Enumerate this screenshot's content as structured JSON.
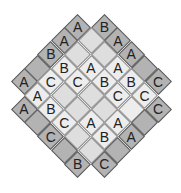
{
  "puzzle": {
    "type": "diagonal-latin-grid",
    "symbols": [
      "A",
      "B",
      "C"
    ],
    "colors": {
      "clue_cell": "#b3b3b3",
      "inner_cell": "#ededed",
      "inner_cell_shaded": "#dedede",
      "border": "#5a5a5a",
      "text": "#222222"
    },
    "cells": [
      {
        "c": 4,
        "r": 0,
        "kind": "clue",
        "v": "A"
      },
      {
        "c": 6,
        "r": 0,
        "kind": "clue",
        "v": "B"
      },
      {
        "c": 3,
        "r": 1,
        "kind": "clue",
        "v": "A"
      },
      {
        "c": 5,
        "r": 1,
        "kind": "inner",
        "v": "",
        "shade": true
      },
      {
        "c": 7,
        "r": 1,
        "kind": "clue",
        "v": "A"
      },
      {
        "c": 2,
        "r": 2,
        "kind": "clue",
        "v": "B"
      },
      {
        "c": 4,
        "r": 2,
        "kind": "inner",
        "v": "",
        "shade": true
      },
      {
        "c": 6,
        "r": 2,
        "kind": "inner",
        "v": "",
        "shade": true
      },
      {
        "c": 8,
        "r": 2,
        "kind": "clue",
        "v": "A"
      },
      {
        "c": 1,
        "r": 3,
        "kind": "clue",
        "v": ""
      },
      {
        "c": 3,
        "r": 3,
        "kind": "inner",
        "v": "B"
      },
      {
        "c": 5,
        "r": 3,
        "kind": "inner",
        "v": "A"
      },
      {
        "c": 7,
        "r": 3,
        "kind": "inner",
        "v": "A"
      },
      {
        "c": 9,
        "r": 3,
        "kind": "clue",
        "v": ""
      },
      {
        "c": 0,
        "r": 4,
        "kind": "clue",
        "v": "A"
      },
      {
        "c": 2,
        "r": 4,
        "kind": "inner",
        "v": "C"
      },
      {
        "c": 4,
        "r": 4,
        "kind": "inner",
        "v": "C"
      },
      {
        "c": 6,
        "r": 4,
        "kind": "inner",
        "v": "B"
      },
      {
        "c": 8,
        "r": 4,
        "kind": "inner",
        "v": "B"
      },
      {
        "c": 10,
        "r": 4,
        "kind": "clue",
        "v": "C"
      },
      {
        "c": 1,
        "r": 5,
        "kind": "inner",
        "v": "A"
      },
      {
        "c": 3,
        "r": 5,
        "kind": "inner",
        "v": "",
        "shade": true
      },
      {
        "c": 5,
        "r": 5,
        "kind": "inner",
        "v": "",
        "shade": true
      },
      {
        "c": 7,
        "r": 5,
        "kind": "inner",
        "v": "C"
      },
      {
        "c": 9,
        "r": 5,
        "kind": "inner",
        "v": "C"
      },
      {
        "c": 0,
        "r": 6,
        "kind": "clue",
        "v": "A"
      },
      {
        "c": 2,
        "r": 6,
        "kind": "inner",
        "v": "B"
      },
      {
        "c": 4,
        "r": 6,
        "kind": "inner",
        "v": "",
        "shade": true
      },
      {
        "c": 6,
        "r": 6,
        "kind": "inner",
        "v": "",
        "shade": true
      },
      {
        "c": 8,
        "r": 6,
        "kind": "inner",
        "v": ""
      },
      {
        "c": 10,
        "r": 6,
        "kind": "clue",
        "v": "C"
      },
      {
        "c": 1,
        "r": 7,
        "kind": "clue",
        "v": ""
      },
      {
        "c": 3,
        "r": 7,
        "kind": "inner",
        "v": "C"
      },
      {
        "c": 5,
        "r": 7,
        "kind": "inner",
        "v": "A"
      },
      {
        "c": 7,
        "r": 7,
        "kind": "inner",
        "v": "A"
      },
      {
        "c": 9,
        "r": 7,
        "kind": "clue",
        "v": ""
      },
      {
        "c": 2,
        "r": 8,
        "kind": "clue",
        "v": "C"
      },
      {
        "c": 4,
        "r": 8,
        "kind": "inner",
        "v": "",
        "shade": true
      },
      {
        "c": 6,
        "r": 8,
        "kind": "inner",
        "v": "B"
      },
      {
        "c": 8,
        "r": 8,
        "kind": "clue",
        "v": "A"
      },
      {
        "c": 3,
        "r": 9,
        "kind": "clue",
        "v": ""
      },
      {
        "c": 5,
        "r": 9,
        "kind": "inner",
        "v": "",
        "shade": true
      },
      {
        "c": 7,
        "r": 9,
        "kind": "clue",
        "v": ""
      },
      {
        "c": 4,
        "r": 10,
        "kind": "clue",
        "v": "B"
      },
      {
        "c": 6,
        "r": 10,
        "kind": "clue",
        "v": "C"
      }
    ]
  }
}
